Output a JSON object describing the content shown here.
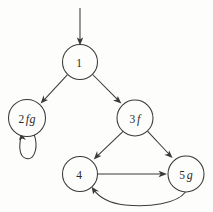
{
  "diagram": {
    "background_color": "#fdfdfb",
    "stroke_color": "#3a3a3a",
    "nodes": [
      {
        "id": "1",
        "number": "1",
        "symbols": "",
        "cx": 80,
        "cy": 62,
        "r": 17.5
      },
      {
        "id": "2",
        "number": "2",
        "symbols": "fg",
        "cx": 27,
        "cy": 118,
        "r": 18.5
      },
      {
        "id": "3",
        "number": "3",
        "symbols": "f",
        "cx": 135,
        "cy": 118,
        "r": 18.0
      },
      {
        "id": "4",
        "number": "4",
        "symbols": "",
        "cx": 80,
        "cy": 174,
        "r": 17.5
      },
      {
        "id": "5",
        "number": "5",
        "symbols": "g",
        "cx": 186,
        "cy": 174,
        "r": 18.0
      }
    ],
    "edges": [
      {
        "id": "start-1",
        "from": "start",
        "to": "1",
        "kind": "entry"
      },
      {
        "id": "1-2",
        "from": "1",
        "to": "2",
        "kind": "straight"
      },
      {
        "id": "1-3",
        "from": "1",
        "to": "3",
        "kind": "straight"
      },
      {
        "id": "2-2",
        "from": "2",
        "to": "2",
        "kind": "self-loop"
      },
      {
        "id": "3-4",
        "from": "3",
        "to": "4",
        "kind": "straight"
      },
      {
        "id": "3-5",
        "from": "3",
        "to": "5",
        "kind": "straight"
      },
      {
        "id": "4-5",
        "from": "4",
        "to": "5",
        "kind": "straight"
      },
      {
        "id": "5-4",
        "from": "5",
        "to": "4",
        "kind": "curved"
      }
    ]
  }
}
